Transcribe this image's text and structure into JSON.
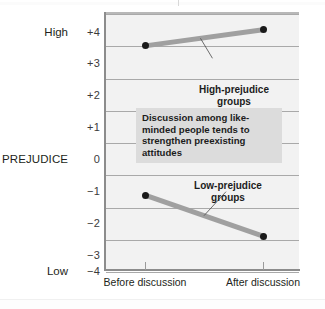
{
  "chart_data": {
    "type": "line",
    "title": "",
    "subtitle": "",
    "xlabel": "",
    "ylabel": "PREJUDICE",
    "categories": [
      "Before discussion",
      "After discussion"
    ],
    "ylim": [
      -4,
      4
    ],
    "yticks": [
      4,
      3,
      2,
      1,
      0,
      -1,
      -2,
      -3,
      -4
    ],
    "ytick_labels": [
      "+4",
      "+3",
      "+2",
      "+1",
      "0",
      "−1",
      "−2",
      "−3",
      "−4"
    ],
    "y_axis_high_label": "High",
    "y_axis_low_label": "Low",
    "grid": true,
    "legend_position": "inline-callouts",
    "series": [
      {
        "name": "High-prejudice groups",
        "values": [
          2.95,
          3.45
        ],
        "color": "#a0a0a0",
        "marker_color": "#1a1a1a"
      },
      {
        "name": "Low-prejudice groups",
        "values": [
          -1.68,
          -2.95
        ],
        "color": "#a0a0a0",
        "marker_color": "#1a1a1a"
      }
    ],
    "annotations": [
      {
        "id": "callout-high",
        "text_line_1": "High-prejudice",
        "text_line_2": "groups"
      },
      {
        "id": "callout-low",
        "text_line_1": "Low-prejudice",
        "text_line_2": "groups"
      },
      {
        "id": "annotation-box",
        "text": "Discussion among like-minded people tends to strengthen preexisting attitudes",
        "background": "#dcdcdc"
      }
    ]
  },
  "yticks": {
    "t0": "+4",
    "t1": "+3",
    "t2": "+2",
    "t3": "+1",
    "t4": "0",
    "t5": "−1",
    "t6": "−2",
    "t7": "−3",
    "t8": "−4"
  },
  "axis": {
    "high": "High",
    "low": "Low",
    "prejudice": "PREJUDICE",
    "x_before": "Before discussion",
    "x_after": "After discussion"
  },
  "callouts": {
    "high_line1": "High-prejudice",
    "high_line2": "groups",
    "low_line1": "Low-prejudice",
    "low_line2": "groups"
  },
  "annotation": {
    "text": "Discussion among like-minded people tends to strengthen preexisting attitudes"
  },
  "colors": {
    "panel_background": "#f2f2f2",
    "gridline": "#a9a9a9",
    "series_line": "#a0a0a0",
    "marker": "#1a1a1a",
    "annotation_background": "#dcdcdc",
    "text": "#231f20"
  }
}
